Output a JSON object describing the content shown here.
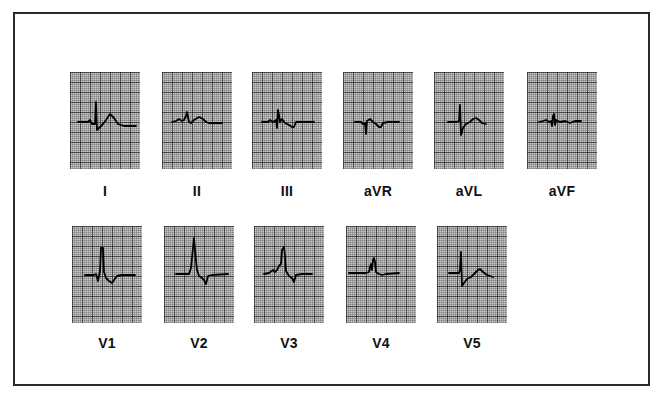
{
  "figure": {
    "colors": {
      "grid_background": "#c9c9c9",
      "grid_minor": "#3a3a3a",
      "grid_major": "#1a1a1a",
      "trace": "#000000",
      "frame": "#2a2a2a"
    },
    "leads": [
      {
        "label": "I",
        "x": 70,
        "y": 72,
        "wave": "M8,50 L18,50 L20,48 L22,52 L25,52 L26,30 L27,58 L29,56 L33,52 L36,48 L40,42 L44,46 L48,52 L54,54 L66,54"
      },
      {
        "label": "II",
        "x": 162,
        "y": 72,
        "wave": "M10,50 L14,49 L17,47 L20,49 L22,48 L24,44 L25,40 L27,50 L29,51 L32,48 L37,45 L41,47 L44,50 L47,51 L60,51"
      },
      {
        "label": "III",
        "x": 252,
        "y": 72,
        "wave": "M10,50 L16,50 L18,48 L21,50 L24,48 L25,56 L26,38 L27,43 L28,50 L30,47 L33,51 L37,53 L40,55 L42,55 L44,50 L48,50 L62,50"
      },
      {
        "label": "aVR",
        "x": 343,
        "y": 72,
        "wave": "M12,50 L18,50 L20,52 L22,51 L23,62 L24,49 L27,47 L30,50 L33,52 L36,55 L38,55 L40,51 L45,50 L56,50"
      },
      {
        "label": "aVL",
        "x": 434,
        "y": 72,
        "wave": "M14,50 L23,50 L25,49 L26,33 L27,63 L29,56 L32,52 L36,50 L39,47 L42,46 L45,48 L48,51 L52,52"
      },
      {
        "label": "aVF",
        "x": 527,
        "y": 72,
        "wave": "M12,50 L16,49 L19,48 L22,50 L24,49 L25,54 L26,44 L27,42 L28,53 L29,48 L33,50 L38,49 L43,51 L48,49 L54,49"
      },
      {
        "label": "V1",
        "x": 72,
        "y": 226,
        "wave": "M13,49 L22,49 L24,48 L26,55 L28,45 L29,22 L31,22 L32,46 L34,52 L37,55 L40,57 L42,54 L45,50 L50,49 L63,49"
      },
      {
        "label": "V2",
        "x": 164,
        "y": 226,
        "wave": "M12,48 L25,48 L27,42 L28,32 L30,12 L32,35 L33,44 L35,50 L38,52 L40,54 L42,58 L44,50 L48,49 L64,48"
      },
      {
        "label": "V3",
        "x": 254,
        "y": 226,
        "wave": "M10,48 L15,47 L19,44 L21,46 L23,44 L25,40 L27,38 L28,24 L30,21 L31,30 L32,45 L35,50 L38,52 L40,56 L42,49 L48,48 L58,48"
      },
      {
        "label": "V4",
        "x": 346,
        "y": 226,
        "wave": "M3,47 L20,47 L23,46 L24,41 L25,38 L26,44 L27,34 L28,32 L29,36 L30,46 L33,48 L36,49 L40,48 L53,47"
      },
      {
        "label": "V5",
        "x": 437,
        "y": 226,
        "wave": "M12,47 L22,47 L23,44 L24,26 L25,60 L27,57 L30,53 L34,51 L37,48 L41,44 L43,43 L46,46 L50,49 L56,51"
      }
    ]
  }
}
